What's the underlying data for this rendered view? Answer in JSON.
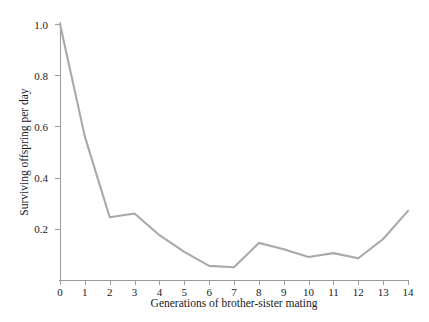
{
  "chart_data": {
    "type": "line",
    "title": "",
    "xlabel": "Generations of brother-sister mating",
    "ylabel": "Surviving offspring per day",
    "x": [
      0,
      1,
      2,
      3,
      4,
      5,
      6,
      7,
      8,
      9,
      10,
      11,
      12,
      13,
      14
    ],
    "values": [
      1.0,
      0.56,
      0.245,
      0.26,
      0.175,
      0.11,
      0.055,
      0.05,
      0.145,
      0.12,
      0.09,
      0.105,
      0.085,
      0.16,
      0.27
    ],
    "series": [
      {
        "name": "Surviving offspring per day",
        "values": [
          1.0,
          0.56,
          0.245,
          0.26,
          0.175,
          0.11,
          0.055,
          0.05,
          0.145,
          0.12,
          0.09,
          0.105,
          0.085,
          0.16,
          0.27
        ]
      }
    ],
    "xlim": [
      0,
      14
    ],
    "ylim": [
      0,
      1.0
    ],
    "xticks": [
      0,
      1,
      2,
      3,
      4,
      5,
      6,
      7,
      8,
      9,
      10,
      11,
      12,
      13,
      14
    ],
    "xtick_labels": [
      "0",
      "1",
      "2",
      "3",
      "4",
      "5",
      "6",
      "7",
      "8",
      "9",
      "10",
      "11",
      "12",
      "13",
      "14"
    ],
    "yticks": [
      0.2,
      0.4,
      0.6,
      0.8,
      1.0
    ],
    "ytick_labels": [
      "0.2",
      "0.4",
      "0.6",
      "0.8",
      "1.0"
    ],
    "grid": false,
    "legend": false,
    "legend_position": "none",
    "line_color": "#a9a9a9",
    "axis_color": "#9a9a9a",
    "background_color": "#ffffff",
    "text_color": "#1a1a1a"
  }
}
